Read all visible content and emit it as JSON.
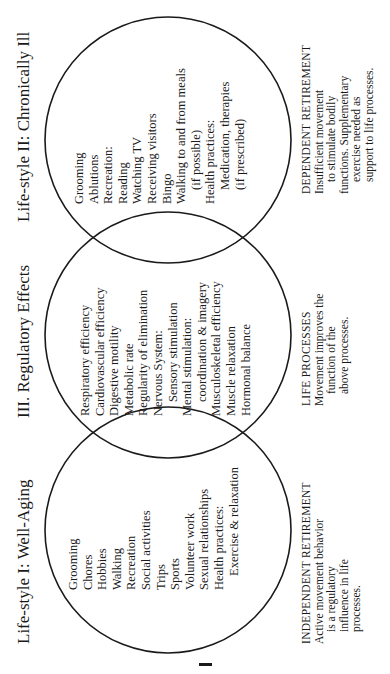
{
  "diagram": {
    "circles": [
      {
        "id": "lifestyle-1",
        "title": "Life-style I: Well-Aging",
        "items": [
          {
            "text": "Grooming",
            "indent": false
          },
          {
            "text": "Chores",
            "indent": false
          },
          {
            "text": "Hobbies",
            "indent": false
          },
          {
            "text": "Walking",
            "indent": false
          },
          {
            "text": "Recreation",
            "indent": false
          },
          {
            "text": "Social activities",
            "indent": false
          },
          {
            "text": "Trips",
            "indent": false
          },
          {
            "text": "Sports",
            "indent": false
          },
          {
            "text": "Volunteer work",
            "indent": false
          },
          {
            "text": "Sexual relationships",
            "indent": false
          },
          {
            "text": "Health practices:",
            "indent": false
          },
          {
            "text": "Exercise & relaxation",
            "indent": true
          }
        ],
        "description": {
          "heading": "INDEPENDENT RETIREMENT",
          "lines": [
            "Active movement behavior",
            "is a regulatory",
            "influence in life",
            "processes."
          ]
        }
      },
      {
        "id": "regulatory-effects",
        "title": "III. Regulatory Effects",
        "items": [
          {
            "text": "Respiratory efficiency",
            "indent": false
          },
          {
            "text": "Cardiovascular efficiency",
            "indent": false
          },
          {
            "text": "Digestive motility",
            "indent": false
          },
          {
            "text": "Metabolic rate",
            "indent": false
          },
          {
            "text": "Regularity of elimination",
            "indent": false
          },
          {
            "text": "Nervous System:",
            "indent": false
          },
          {
            "text": "Sensory stimulation",
            "indent": true
          },
          {
            "text": "Mental stimulation:",
            "indent": false
          },
          {
            "text": "coordination & imagery",
            "indent": true
          },
          {
            "text": "Musculoskeletal efficiency",
            "indent": false
          },
          {
            "text": "Muscle relaxation",
            "indent": false
          },
          {
            "text": "Hormonal balance",
            "indent": false
          }
        ],
        "description": {
          "heading": "LIFE PROCESSES",
          "lines": [
            "Movement improves the",
            "function of the",
            "above processes."
          ]
        }
      },
      {
        "id": "lifestyle-2",
        "title": "Life-style II: Chronically Ill",
        "items": [
          {
            "text": "Grooming",
            "indent": false
          },
          {
            "text": "Ablutions",
            "indent": false
          },
          {
            "text": "Recreation:",
            "indent": false
          },
          {
            "text": "Reading",
            "indent": false
          },
          {
            "text": "Watching TV",
            "indent": false
          },
          {
            "text": "Receiving visitors",
            "indent": false
          },
          {
            "text": "Bingo",
            "indent": false
          },
          {
            "text": "Walking to and from meals",
            "indent": false
          },
          {
            "text": "(if possible)",
            "indent": true
          },
          {
            "text": "Health practices:",
            "indent": false
          },
          {
            "text": "Medication, therapies",
            "indent": true
          },
          {
            "text": "(if prescribed)",
            "indent": true
          }
        ],
        "description": {
          "heading": "DEPENDENT RETIREMENT",
          "lines": [
            "Insufficient movement",
            "to stimulate bodily",
            "functions. Supplementary",
            "exercise needed as",
            "support to life processes."
          ]
        }
      }
    ],
    "colors": {
      "line": "#1a1a1a",
      "background": "#ffffff"
    }
  }
}
